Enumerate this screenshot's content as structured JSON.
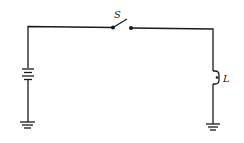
{
  "diagram": {
    "type": "circuit",
    "components": {
      "switch": {
        "label": "S",
        "state": "open"
      },
      "lamp": {
        "label": "L"
      },
      "battery": {
        "label": ""
      },
      "ground_left": {
        "label": ""
      },
      "ground_right": {
        "label": ""
      }
    },
    "colors": {
      "stroke": "#1a1a1a",
      "background": "#ffffff"
    }
  }
}
